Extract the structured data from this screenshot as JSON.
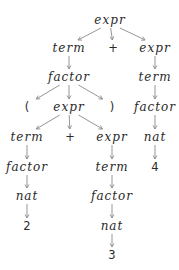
{
  "diagram": {
    "type": "parse-tree",
    "colors": {
      "text": "#2a2a2a",
      "edge": "#8a8a8a",
      "background": "#ffffff"
    },
    "nodes": [
      {
        "id": "n0",
        "label": "expr",
        "kind": "nonterminal",
        "x": 110,
        "y": 20
      },
      {
        "id": "n1",
        "label": "term",
        "kind": "nonterminal",
        "x": 69,
        "y": 48
      },
      {
        "id": "n2",
        "label": "+",
        "kind": "terminal",
        "x": 113,
        "y": 48
      },
      {
        "id": "n3",
        "label": "expr",
        "kind": "nonterminal",
        "x": 155,
        "y": 48
      },
      {
        "id": "n4",
        "label": "factor",
        "kind": "nonterminal",
        "x": 69,
        "y": 77
      },
      {
        "id": "n5",
        "label": "term",
        "kind": "nonterminal",
        "x": 155,
        "y": 77
      },
      {
        "id": "n6",
        "label": "(",
        "kind": "terminal",
        "x": 27,
        "y": 107
      },
      {
        "id": "n7",
        "label": "expr",
        "kind": "nonterminal",
        "x": 69,
        "y": 107
      },
      {
        "id": "n8",
        "label": ")",
        "kind": "terminal",
        "x": 112,
        "y": 107
      },
      {
        "id": "n9",
        "label": "factor",
        "kind": "nonterminal",
        "x": 155,
        "y": 107
      },
      {
        "id": "n10",
        "label": "term",
        "kind": "nonterminal",
        "x": 27,
        "y": 137
      },
      {
        "id": "n11",
        "label": "+",
        "kind": "terminal",
        "x": 70,
        "y": 137
      },
      {
        "id": "n12",
        "label": "expr",
        "kind": "nonterminal",
        "x": 112,
        "y": 137
      },
      {
        "id": "n13",
        "label": "nat",
        "kind": "nonterminal",
        "x": 155,
        "y": 137
      },
      {
        "id": "n14",
        "label": "factor",
        "kind": "nonterminal",
        "x": 27,
        "y": 167
      },
      {
        "id": "n15",
        "label": "term",
        "kind": "nonterminal",
        "x": 112,
        "y": 167
      },
      {
        "id": "n16",
        "label": "4",
        "kind": "terminal",
        "x": 155,
        "y": 167
      },
      {
        "id": "n17",
        "label": "nat",
        "kind": "nonterminal",
        "x": 27,
        "y": 196
      },
      {
        "id": "n18",
        "label": "factor",
        "kind": "nonterminal",
        "x": 112,
        "y": 196
      },
      {
        "id": "n19",
        "label": "2",
        "kind": "terminal",
        "x": 27,
        "y": 226
      },
      {
        "id": "n20",
        "label": "nat",
        "kind": "nonterminal",
        "x": 112,
        "y": 226
      },
      {
        "id": "n21",
        "label": "3",
        "kind": "terminal",
        "x": 112,
        "y": 255
      }
    ],
    "edges": [
      [
        "n0",
        "n1"
      ],
      [
        "n0",
        "n2"
      ],
      [
        "n0",
        "n3"
      ],
      [
        "n1",
        "n4"
      ],
      [
        "n3",
        "n5"
      ],
      [
        "n4",
        "n6"
      ],
      [
        "n4",
        "n7"
      ],
      [
        "n4",
        "n8"
      ],
      [
        "n5",
        "n9"
      ],
      [
        "n7",
        "n10"
      ],
      [
        "n7",
        "n11"
      ],
      [
        "n7",
        "n12"
      ],
      [
        "n9",
        "n13"
      ],
      [
        "n10",
        "n14"
      ],
      [
        "n12",
        "n15"
      ],
      [
        "n13",
        "n16"
      ],
      [
        "n14",
        "n17"
      ],
      [
        "n15",
        "n18"
      ],
      [
        "n17",
        "n19"
      ],
      [
        "n18",
        "n20"
      ],
      [
        "n20",
        "n21"
      ]
    ]
  }
}
